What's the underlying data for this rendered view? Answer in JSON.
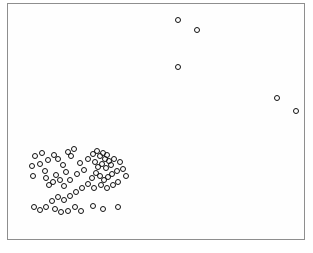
{
  "figure": {
    "title": "",
    "background_color": "#ffffff",
    "frame_color": "#8e8e8e",
    "marker_color": "#111111",
    "marker_shape": "open-circle",
    "frame": {
      "x": 7,
      "y": 3,
      "width": 298,
      "height": 237
    }
  },
  "chart_data": {
    "type": "scatter",
    "title": "",
    "xlabel": "",
    "ylabel": "",
    "xlim": [
      0,
      298
    ],
    "ylim": [
      0,
      237
    ],
    "grid": false,
    "legend": null,
    "axis_ticks_visible": false,
    "tick_labels": {
      "x": [],
      "y": []
    },
    "marker_style": {
      "shape": "circle",
      "filled": false,
      "edge_color": "#111111",
      "size_px": 6
    },
    "series": [
      {
        "name": "points",
        "n_points": 76,
        "points": [
          [
            170,
            16
          ],
          [
            189,
            26
          ],
          [
            170,
            63
          ],
          [
            269,
            94
          ],
          [
            288,
            107
          ],
          [
            27,
            152
          ],
          [
            34,
            149
          ],
          [
            40,
            156
          ],
          [
            32,
            160
          ],
          [
            24,
            162
          ],
          [
            46,
            151
          ],
          [
            50,
            155
          ],
          [
            37,
            167
          ],
          [
            25,
            172
          ],
          [
            55,
            161
          ],
          [
            60,
            148
          ],
          [
            66,
            145
          ],
          [
            63,
            152
          ],
          [
            58,
            168
          ],
          [
            52,
            176
          ],
          [
            45,
            178
          ],
          [
            48,
            171
          ],
          [
            41,
            181
          ],
          [
            38,
            174
          ],
          [
            56,
            182
          ],
          [
            62,
            176
          ],
          [
            69,
            170
          ],
          [
            72,
            159
          ],
          [
            76,
            166
          ],
          [
            80,
            155
          ],
          [
            85,
            150
          ],
          [
            89,
            147
          ],
          [
            92,
            152
          ],
          [
            95,
            149
          ],
          [
            97,
            155
          ],
          [
            99,
            151
          ],
          [
            101,
            157
          ],
          [
            94,
            160
          ],
          [
            90,
            163
          ],
          [
            87,
            158
          ],
          [
            98,
            164
          ],
          [
            103,
            161
          ],
          [
            106,
            155
          ],
          [
            109,
            167
          ],
          [
            104,
            170
          ],
          [
            100,
            173
          ],
          [
            96,
            176
          ],
          [
            92,
            172
          ],
          [
            88,
            169
          ],
          [
            84,
            174
          ],
          [
            112,
            158
          ],
          [
            115,
            165
          ],
          [
            118,
            172
          ],
          [
            110,
            178
          ],
          [
            105,
            181
          ],
          [
            99,
            184
          ],
          [
            93,
            181
          ],
          [
            86,
            184
          ],
          [
            80,
            180
          ],
          [
            74,
            184
          ],
          [
            68,
            188
          ],
          [
            62,
            192
          ],
          [
            56,
            196
          ],
          [
            50,
            193
          ],
          [
            44,
            197
          ],
          [
            38,
            203
          ],
          [
            32,
            206
          ],
          [
            26,
            203
          ],
          [
            47,
            205
          ],
          [
            53,
            208
          ],
          [
            60,
            207
          ],
          [
            67,
            203
          ],
          [
            73,
            207
          ],
          [
            85,
            202
          ],
          [
            95,
            205
          ],
          [
            110,
            203
          ]
        ]
      }
    ]
  }
}
